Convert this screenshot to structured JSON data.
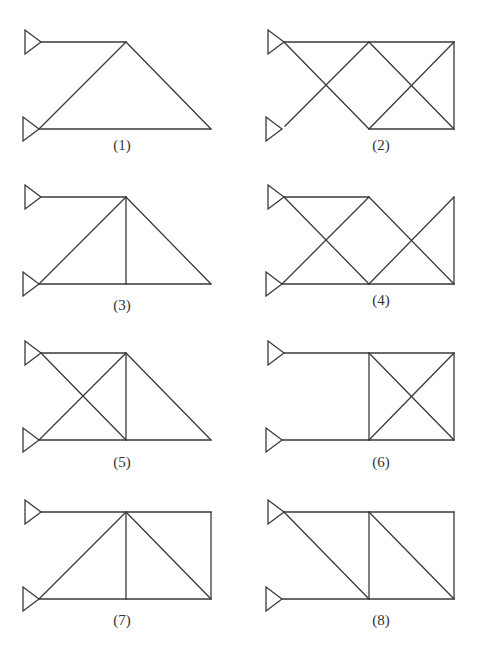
{
  "figure": {
    "title": "",
    "background": "#ffffff",
    "line_color": "#3a3a3a",
    "label_color": "#333333",
    "panel_size": {
      "span_x": 85,
      "span_y": 87
    },
    "node_local": {
      "A": [
        0,
        0
      ],
      "B": [
        -2,
        87
      ],
      "C": [
        85,
        0
      ],
      "D": [
        85,
        87
      ],
      "E": [
        170,
        0
      ],
      "F": [
        170,
        87
      ]
    },
    "node_roles": {
      "A": "upper pin support",
      "B": "lower pin support",
      "C": "top middle joint",
      "D": "bottom middle joint",
      "E": "top right joint",
      "F": "bottom right joint"
    },
    "panels": [
      {
        "id": 1,
        "label": "(1)",
        "origin": [
          41,
          42
        ],
        "label_pos": [
          122,
          150
        ],
        "members": [
          [
            "A",
            "C"
          ],
          [
            "B",
            "C"
          ],
          [
            "C",
            "F"
          ],
          [
            "B",
            "F"
          ]
        ],
        "extra_nodes": [
          "A",
          "B",
          "C",
          "F"
        ]
      },
      {
        "id": 2,
        "label": "(2)",
        "origin": [
          284,
          42
        ],
        "label_pos": [
          381,
          150
        ],
        "members": [
          [
            "A",
            "C"
          ],
          [
            "C",
            "E"
          ],
          [
            "B*",
            "C"
          ],
          [
            "A",
            "D"
          ],
          [
            "C",
            "F"
          ],
          [
            "D",
            "E"
          ],
          [
            "D",
            "F"
          ],
          [
            "E",
            "F"
          ]
        ],
        "note": "member from lower support starts with a small gap at the support"
      },
      {
        "id": 3,
        "label": "(3)",
        "origin": [
          41,
          197
        ],
        "label_pos": [
          122,
          310
        ],
        "members": [
          [
            "A",
            "C"
          ],
          [
            "B",
            "C"
          ],
          [
            "C",
            "D"
          ],
          [
            "C",
            "F"
          ],
          [
            "B",
            "D"
          ],
          [
            "D",
            "F"
          ]
        ]
      },
      {
        "id": 4,
        "label": "(4)",
        "origin": [
          284,
          197
        ],
        "label_pos": [
          381,
          305
        ],
        "members": [
          [
            "A",
            "C"
          ],
          [
            "A",
            "D"
          ],
          [
            "B",
            "C"
          ],
          [
            "C",
            "F"
          ],
          [
            "B",
            "D"
          ],
          [
            "D",
            "F"
          ],
          [
            "D",
            "E"
          ],
          [
            "E",
            "F"
          ]
        ]
      },
      {
        "id": 5,
        "label": "(5)",
        "origin": [
          41,
          353
        ],
        "label_pos": [
          122,
          467
        ],
        "members": [
          [
            "A",
            "C"
          ],
          [
            "A",
            "D"
          ],
          [
            "B",
            "C"
          ],
          [
            "C",
            "D"
          ],
          [
            "C",
            "F"
          ],
          [
            "B",
            "D"
          ],
          [
            "D",
            "F"
          ]
        ]
      },
      {
        "id": 6,
        "label": "(6)",
        "origin": [
          284,
          353
        ],
        "label_pos": [
          381,
          467
        ],
        "members": [
          [
            "A",
            "C"
          ],
          [
            "B",
            "D"
          ],
          [
            "C",
            "E"
          ],
          [
            "D",
            "F"
          ],
          [
            "C",
            "D"
          ],
          [
            "E",
            "F"
          ],
          [
            "C",
            "F"
          ],
          [
            "D",
            "E"
          ]
        ]
      },
      {
        "id": 7,
        "label": "(7)",
        "origin": [
          41,
          512
        ],
        "label_pos": [
          122,
          625
        ],
        "members": [
          [
            "A",
            "C"
          ],
          [
            "C",
            "E"
          ],
          [
            "B",
            "C"
          ],
          [
            "C",
            "D"
          ],
          [
            "C",
            "F"
          ],
          [
            "B",
            "D"
          ],
          [
            "D",
            "F"
          ],
          [
            "E",
            "F"
          ]
        ]
      },
      {
        "id": 8,
        "label": "(8)",
        "origin": [
          284,
          512
        ],
        "label_pos": [
          381,
          625
        ],
        "members": [
          [
            "A",
            "C"
          ],
          [
            "C",
            "E"
          ],
          [
            "A",
            "D"
          ],
          [
            "C",
            "D"
          ],
          [
            "C",
            "F"
          ],
          [
            "B",
            "D"
          ],
          [
            "D",
            "F"
          ],
          [
            "E",
            "F"
          ]
        ]
      }
    ]
  }
}
